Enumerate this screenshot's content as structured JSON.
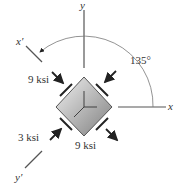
{
  "diagram": {
    "axes": {
      "x": "x",
      "y": "y",
      "x_prime": "x′",
      "y_prime": "y′"
    },
    "angle_label": "135°",
    "stresses": {
      "top_left": "9 ksi",
      "bottom_center": "9 ksi",
      "bottom_left": "3 ksi"
    },
    "colors": {
      "line": "#444444",
      "element_light": "#e8e8e8",
      "element_dark": "#8c8c8c"
    }
  }
}
